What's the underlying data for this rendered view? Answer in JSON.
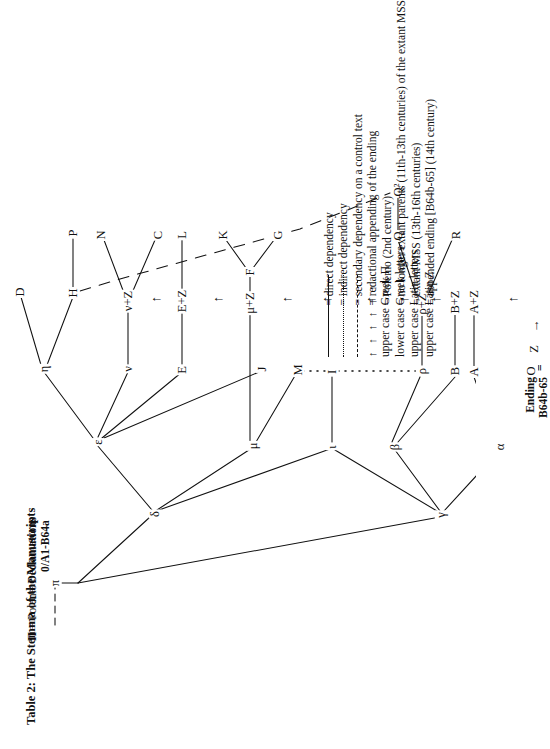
{
  "document": {
    "title": "Table 2:  The Stemma of the Manuscripts"
  },
  "annotations": {
    "polemo_symbol": "Π",
    "polemo_eq": "=",
    "polemo_label": "Polemo",
    "archetype_symbol": "π",
    "archetype_eq": "=",
    "archetype_label_line1": "Declamations",
    "archetype_label_line2": "0/A1-B64a",
    "ending_line1": "Ending",
    "ending_line2": "B64b-65",
    "ending_eq": "="
  },
  "stemma": {
    "nodes": [
      {
        "id": "pi",
        "label": "π",
        "kind": "greek-lower"
      },
      {
        "id": "delta",
        "label": "δ",
        "kind": "greek-lower"
      },
      {
        "id": "gamma",
        "label": "γ",
        "kind": "greek-lower"
      },
      {
        "id": "epsilon",
        "label": "ε",
        "kind": "greek-lower"
      },
      {
        "id": "mu",
        "label": "μ",
        "kind": "greek-lower"
      },
      {
        "id": "iota",
        "label": "ι",
        "kind": "greek-lower"
      },
      {
        "id": "beta",
        "label": "β",
        "kind": "greek-lower"
      },
      {
        "id": "alpha",
        "label": "α",
        "kind": "greek-lower"
      },
      {
        "id": "rho",
        "label": "ρ",
        "kind": "greek-lower"
      },
      {
        "id": "eta",
        "label": "η",
        "kind": "greek-lower"
      },
      {
        "id": "nu",
        "label": "ν",
        "kind": "greek-lower"
      },
      {
        "id": "D",
        "label": "D",
        "kind": "latin-upper"
      },
      {
        "id": "H",
        "label": "H",
        "kind": "latin-upper"
      },
      {
        "id": "P",
        "label": "P",
        "kind": "latin-upper"
      },
      {
        "id": "N",
        "label": "N",
        "kind": "latin-upper"
      },
      {
        "id": "C",
        "label": "C",
        "kind": "latin-upper"
      },
      {
        "id": "E",
        "label": "E",
        "kind": "latin-upper"
      },
      {
        "id": "L",
        "label": "L",
        "kind": "latin-upper"
      },
      {
        "id": "J",
        "label": "J",
        "kind": "latin-upper"
      },
      {
        "id": "F",
        "label": "F",
        "kind": "latin-upper"
      },
      {
        "id": "G",
        "label": "G",
        "kind": "latin-upper"
      },
      {
        "id": "K",
        "label": "K",
        "kind": "latin-upper"
      },
      {
        "id": "M",
        "label": "M",
        "kind": "latin-upper"
      },
      {
        "id": "I",
        "label": "I",
        "kind": "latin-upper"
      },
      {
        "id": "B",
        "label": "B",
        "kind": "latin-upper"
      },
      {
        "id": "A",
        "label": "A",
        "kind": "latin-upper"
      },
      {
        "id": "O",
        "label": "O",
        "kind": "latin-upper"
      },
      {
        "id": "R",
        "label": "R",
        "kind": "latin-upper"
      },
      {
        "id": "Q",
        "label": "Q",
        "kind": "latin-upper"
      },
      {
        "id": "Q2",
        "label": "Q²",
        "kind": "latin-upper"
      },
      {
        "id": "Z",
        "label": "Z",
        "kind": "ending"
      },
      {
        "id": "AZ",
        "label": "A+Z",
        "kind": "ending"
      },
      {
        "id": "BZ",
        "label": "B+Z",
        "kind": "ending"
      },
      {
        "id": "rhoZ",
        "label": "ρ+Z",
        "kind": "ending"
      },
      {
        "id": "muZ",
        "label": "μ+Z",
        "kind": "ending"
      },
      {
        "id": "EZ",
        "label": "E+Z",
        "kind": "ending"
      },
      {
        "id": "nuZ",
        "label": "ν+Z",
        "kind": "ending"
      }
    ]
  },
  "legend": {
    "rows": [
      {
        "symbol_type": "solid",
        "symbol_text": "",
        "eq": "=",
        "text": "direct dependency"
      },
      {
        "symbol_type": "dotted",
        "symbol_text": "",
        "eq": "=",
        "text": "indirect dependency"
      },
      {
        "symbol_type": "dashed",
        "symbol_text": "",
        "eq": "=",
        "text": "secondary dependency on a control text"
      },
      {
        "symbol_type": "arrows",
        "symbol_text": "↑ ↑ ↑ ↑ ↑ ↑",
        "eq": "=",
        "text": "redactional appending of the ending"
      },
      {
        "symbol_type": "word",
        "symbol_text": "upper case Greek Π",
        "eq": "=",
        "text": "Polemo (2nd century)"
      },
      {
        "symbol_type": "word",
        "symbol_text": "lower case Greek letters",
        "eq": "=",
        "text": "no longer extant parents (11th-13th centuries) of the extant MSS"
      },
      {
        "symbol_type": "word",
        "symbol_text": "upper case Latin letters",
        "eq": "=",
        "text": "extant MSS (13th-16th centuries)"
      },
      {
        "symbol_type": "word",
        "symbol_text": "upper case Latin Z",
        "eq": "=",
        "text": "appended ending [B64b-65] (14th century)"
      }
    ]
  },
  "colors": {
    "ink": "#111111",
    "page": "#ffffff"
  }
}
